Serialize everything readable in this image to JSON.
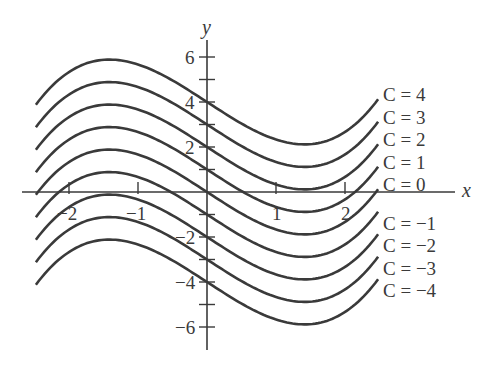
{
  "chart_data": {
    "type": "line",
    "title": "",
    "xlabel": "x",
    "ylabel": "y",
    "xlim": [
      -2.7,
      3.6
    ],
    "ylim": [
      -7,
      7
    ],
    "x_ticks": [
      -2,
      -1,
      1,
      2
    ],
    "x_tick_labels": [
      "−2",
      "−1",
      "1",
      "2"
    ],
    "y_ticks": [
      -6,
      -5,
      -4,
      -3,
      -2,
      -1,
      1,
      2,
      3,
      4,
      5,
      6
    ],
    "y_tick_labels": {
      "-6": "−6",
      "-4": "−4",
      "-2": "−2",
      "2": "2",
      "4": "4",
      "6": "6"
    },
    "grid": false,
    "family_description": "y = x^3/3 - 2x + C (approximate), x from -2.48 to 2.48",
    "x_range": [
      -2.48,
      2.48
    ],
    "series": [
      {
        "name": "C = 4",
        "C": 4
      },
      {
        "name": "C = 3",
        "C": 3
      },
      {
        "name": "C = 2",
        "C": 2
      },
      {
        "name": "C = 1",
        "C": 1
      },
      {
        "name": "C = 0",
        "C": 0
      },
      {
        "name": "C = −1",
        "C": -1
      },
      {
        "name": "C = −2",
        "C": -2
      },
      {
        "name": "C = −3",
        "C": -3
      },
      {
        "name": "C = −4",
        "C": -4
      }
    ],
    "line_color": "#3a3a3a"
  }
}
